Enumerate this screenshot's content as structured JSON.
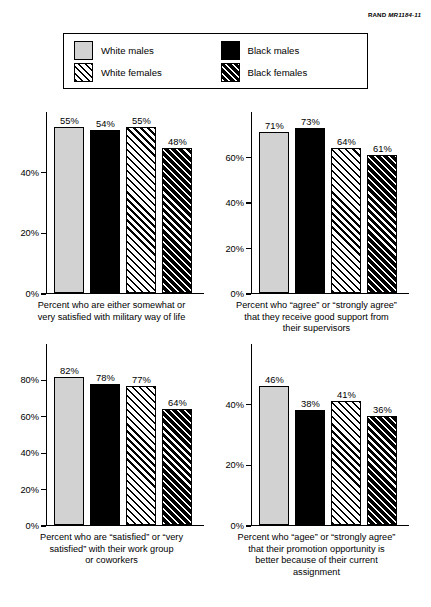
{
  "source_credit": {
    "prefix": "RAND",
    "code": "MR1184-11"
  },
  "legend": {
    "items": [
      {
        "label": "White males",
        "pattern": "solid-light-gray",
        "swatch_class": "sw-wm"
      },
      {
        "label": "Black males",
        "pattern": "solid-black",
        "swatch_class": "sw-bm"
      },
      {
        "label": "White females",
        "pattern": "black-diagonal-hatch-on-white",
        "swatch_class": "sw-wf"
      },
      {
        "label": "Black females",
        "pattern": "white-diagonal-hatch-on-black",
        "swatch_class": "sw-bf"
      }
    ]
  },
  "chart_data": [
    {
      "id": "satisfaction-military-way-of-life",
      "type": "bar",
      "title": "",
      "caption": "Percent who are either somewhat or very satisfied with military way of life",
      "caption_lines": [
        "Percent who are either somewhat or",
        "very satisfied with military way of life"
      ],
      "categories": [
        "White males",
        "Black males",
        "White females",
        "Black females"
      ],
      "values": [
        55,
        54,
        55,
        48
      ],
      "value_labels": [
        "55%",
        "54%",
        "55%",
        "48%"
      ],
      "xlabel": "",
      "ylabel": "",
      "ylim": [
        0,
        60
      ],
      "yticks": [
        0,
        20,
        40
      ],
      "ytick_labels": [
        "0%",
        "20%",
        "40%"
      ],
      "grid": false,
      "legend_position": "top-external"
    },
    {
      "id": "support-from-supervisors",
      "type": "bar",
      "title": "",
      "caption": "Percent who “agree” or “strongly agree” that they receive good support from their supervisors",
      "caption_lines": [
        "Percent who “agree” or “strongly agree”",
        "that they receive good support from",
        "their supervisors"
      ],
      "categories": [
        "White males",
        "Black males",
        "White females",
        "Black females"
      ],
      "values": [
        71,
        73,
        64,
        61
      ],
      "value_labels": [
        "71%",
        "73%",
        "64%",
        "61%"
      ],
      "xlabel": "",
      "ylabel": "",
      "ylim": [
        0,
        80
      ],
      "yticks": [
        0,
        20,
        40,
        60
      ],
      "ytick_labels": [
        "0%",
        "20%",
        "40%",
        "60%"
      ],
      "grid": false,
      "legend_position": "top-external"
    },
    {
      "id": "satisfaction-work-group-coworkers",
      "type": "bar",
      "title": "",
      "caption": "Percent who are “satisfied” or “very satisfied” with their work group or coworkers",
      "caption_lines": [
        "Percent who are “satisfied” or “very",
        "satisfied” with their work group",
        "or coworkers"
      ],
      "categories": [
        "White males",
        "Black males",
        "White females",
        "Black females"
      ],
      "values": [
        82,
        78,
        77,
        64
      ],
      "value_labels": [
        "82%",
        "78%",
        "77%",
        "64%"
      ],
      "xlabel": "",
      "ylabel": "",
      "ylim": [
        0,
        100
      ],
      "yticks": [
        0,
        20,
        40,
        60,
        80
      ],
      "ytick_labels": [
        "0%",
        "20%",
        "40%",
        "60%",
        "80%"
      ],
      "grid": false,
      "legend_position": "top-external"
    },
    {
      "id": "promotion-opportunity-current-assignment",
      "type": "bar",
      "title": "",
      "caption": "Percent who “agee” or “strongly agree” that their promotion opportunity is better because of their current assignment",
      "caption_lines": [
        "Percent who “agee” or “strongly agree”",
        "that their promotion opportunity is",
        "better because of their current",
        "assignment"
      ],
      "categories": [
        "White males",
        "Black males",
        "White females",
        "Black females"
      ],
      "values": [
        46,
        38,
        41,
        36
      ],
      "value_labels": [
        "46%",
        "38%",
        "41%",
        "36%"
      ],
      "xlabel": "",
      "ylabel": "",
      "ylim": [
        0,
        60
      ],
      "yticks": [
        0,
        20,
        40
      ],
      "ytick_labels": [
        "0%",
        "20%",
        "40%"
      ],
      "grid": false,
      "legend_position": "top-external"
    }
  ],
  "colors": {
    "white_males": "#d2d2d2",
    "black_males": "#000000",
    "hatch_line": "#000000",
    "background": "#ffffff",
    "axis": "#000000"
  }
}
